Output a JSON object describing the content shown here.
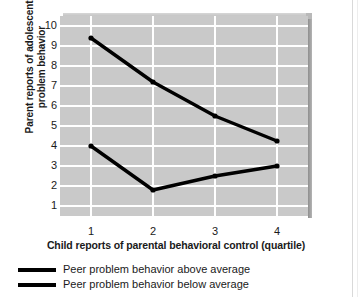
{
  "chart_data": {
    "type": "line",
    "title": "",
    "xlabel": "Child reports of parental behavioral control (quartile)",
    "ylabel": "Parent reports of adolescent problem behavior",
    "ylabel_line1": "Parent reports of adolescent",
    "ylabel_line2": "problem behavior",
    "categories": [
      "1",
      "2",
      "3",
      "4"
    ],
    "x": [
      1,
      2,
      3,
      4
    ],
    "xlim": [
      0.5,
      4.5
    ],
    "ylim": [
      0.5,
      10.5
    ],
    "yticks": [
      "10",
      "9",
      "8",
      "7",
      "6",
      "5",
      "4",
      "3",
      "2",
      "1"
    ],
    "ytick_values": [
      10,
      9,
      8,
      7,
      6,
      5,
      4,
      3,
      2,
      1
    ],
    "xticks": [
      "1",
      "2",
      "3",
      "4"
    ],
    "grid": true,
    "grid_color": "#ffffff",
    "plot_background": "#c9c9c9",
    "line_color": "#000000",
    "legend_position": "below",
    "series": [
      {
        "name": "Peer problem behavior above average",
        "values": [
          9.4,
          7.2,
          5.5,
          4.25
        ]
      },
      {
        "name": "Peer problem behavior below average",
        "values": [
          4.0,
          1.8,
          2.5,
          3.0
        ]
      }
    ]
  },
  "legend": {
    "items": [
      {
        "label": "Peer problem behavior above average"
      },
      {
        "label": "Peer problem behavior below average"
      }
    ]
  }
}
